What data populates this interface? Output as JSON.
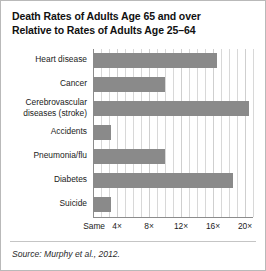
{
  "figure": {
    "title_line1": "Death Rates of Adults Age 65 and over",
    "title_line2": "Relative to Rates of Adults Age 25–64",
    "source": "Source: Murphy et al., 2012.",
    "bar_color": "#8a8a8a",
    "grid_color": "#d8d8d8",
    "axis_color": "#8c8c8c",
    "background": "#ffffff",
    "border_color": "#b9b9b9"
  },
  "chart_data": {
    "type": "bar",
    "orientation": "horizontal",
    "title": "Death Rates of Adults Age 65 and over Relative to Rates of Adults Age 25–64",
    "xlabel": "",
    "ylabel": "",
    "xlim": [
      1,
      21
    ],
    "grid": true,
    "legend": null,
    "tick_labels": [
      "Same",
      "4×",
      "8×",
      "12×",
      "16×",
      "20×"
    ],
    "tick_values": [
      1,
      4,
      8,
      12,
      16,
      20
    ],
    "minor_tick_step": 1,
    "categories": [
      "Heart disease",
      "Cancer",
      "Cerebrovascular diseases (stroke)",
      "Accidents",
      "Pneumonia/flu",
      "Diabetes",
      "Suicide"
    ],
    "category_lines": [
      [
        "Heart disease"
      ],
      [
        "Cancer"
      ],
      [
        "Cerebrovascular",
        "diseases (stroke)"
      ],
      [
        "Accidents"
      ],
      [
        "Pneumonia/flu"
      ],
      [
        "Diabetes"
      ],
      [
        "Suicide"
      ]
    ],
    "values": [
      16.5,
      10,
      20.5,
      3.3,
      10,
      18.5,
      3.3
    ],
    "value_unit": "× (times the rate of adults age 25–64)"
  }
}
